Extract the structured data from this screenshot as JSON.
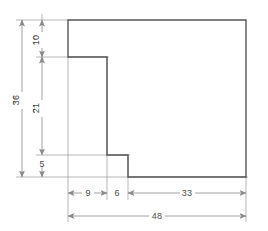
{
  "drawing": {
    "title": "Stepped profile orthographic outline with dimensions",
    "units": "",
    "colors": {
      "object_line": "#555555",
      "dimension_line": "#8a8a8a",
      "extension_line": "#9a9a9a",
      "text": "#4a4a4a",
      "background": "#ffffff"
    },
    "outline": {
      "name": "stepped-profile",
      "vertices": [
        [
          68,
          20
        ],
        [
          246,
          20
        ],
        [
          246,
          177
        ],
        [
          128,
          177
        ],
        [
          128,
          155
        ],
        [
          107,
          155
        ],
        [
          107,
          57
        ],
        [
          68,
          57
        ]
      ]
    },
    "vertical_dimensions": [
      {
        "id": "dim-10",
        "label": "10",
        "value": 10,
        "orientation": "vertical",
        "x": 42,
        "y1": 20,
        "y2": 57,
        "label_x": 39,
        "label_y": 40
      },
      {
        "id": "dim-21",
        "label": "21",
        "value": 21,
        "orientation": "vertical",
        "x": 42,
        "y1": 57,
        "y2": 155,
        "label_x": 39,
        "label_y": 108
      },
      {
        "id": "dim-5",
        "label": "5",
        "value": 5,
        "orientation": "vertical",
        "x": 42,
        "y1": 155,
        "y2": 177,
        "label_x": 39,
        "label_y": 170
      },
      {
        "id": "dim-36",
        "label": "36",
        "value": 36,
        "orientation": "vertical",
        "x": 22,
        "y1": 20,
        "y2": 177,
        "label_x": 19,
        "label_y": 100
      }
    ],
    "horizontal_dimensions": [
      {
        "id": "dim-9",
        "label": "9",
        "value": 9,
        "orientation": "horizontal",
        "y": 193,
        "x1": 68,
        "x2": 107,
        "label_x": 88,
        "label_y": 196
      },
      {
        "id": "dim-6",
        "label": "6",
        "value": 6,
        "orientation": "horizontal",
        "y": 193,
        "x1": 107,
        "x2": 128,
        "label_x": 117,
        "label_y": 196
      },
      {
        "id": "dim-33",
        "label": "33",
        "value": 33,
        "orientation": "horizontal",
        "y": 193,
        "x1": 128,
        "x2": 246,
        "label_x": 187,
        "label_y": 196
      },
      {
        "id": "dim-48",
        "label": "48",
        "value": 48,
        "orientation": "horizontal",
        "y": 216,
        "x1": 68,
        "x2": 246,
        "label_x": 157,
        "label_y": 219
      }
    ],
    "labels": {
      "v10": "10",
      "v21": "21",
      "v5": "5",
      "v36": "36",
      "h9": "9",
      "h6": "6",
      "h33": "33",
      "h48": "48"
    }
  }
}
